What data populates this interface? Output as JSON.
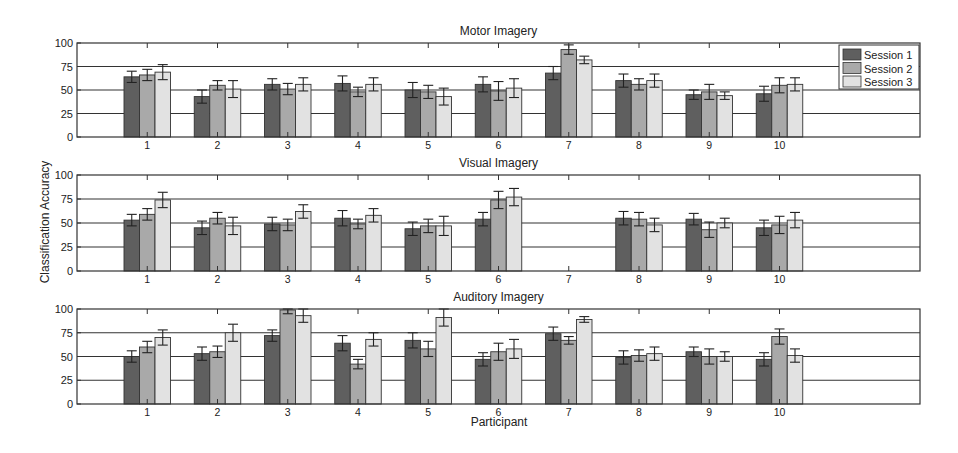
{
  "figure": {
    "ylabel": "Classification Accuracy",
    "xlabel": "Participant",
    "colors": {
      "Session 1": "#5f5f5f",
      "Session 2": "#a9a9a9",
      "Session 3": "#e2e2e2"
    },
    "legend": {
      "position": "upper right of top panel",
      "entries": [
        "Session 1",
        "Session 2",
        "Session 3"
      ]
    }
  },
  "chart_data": [
    {
      "type": "bar",
      "title": "Motor Imagery",
      "xlabel": "",
      "ylabel": "Classification Accuracy",
      "categories": [
        "1",
        "2",
        "3",
        "4",
        "5",
        "6",
        "7",
        "8",
        "9",
        "10"
      ],
      "ylim": [
        0,
        100
      ],
      "yticks": [
        0,
        25,
        50,
        75,
        100
      ],
      "grid": "horizontal lines at 25, 50, 75",
      "legend": [
        "Session 1",
        "Session 2",
        "Session 3"
      ],
      "series": [
        {
          "name": "Session 1",
          "values": [
            64,
            43,
            56,
            57,
            50,
            56,
            68,
            60,
            45,
            46
          ],
          "errors": [
            6,
            7,
            6,
            8,
            8,
            8,
            7,
            7,
            5,
            8
          ]
        },
        {
          "name": "Session 2",
          "values": [
            66,
            55,
            51,
            48,
            48,
            49,
            93,
            56,
            48,
            55
          ],
          "errors": [
            6,
            5,
            6,
            5,
            7,
            10,
            5,
            6,
            8,
            8
          ]
        },
        {
          "name": "Session 3",
          "values": [
            69,
            51,
            56,
            56,
            43,
            52,
            82,
            60,
            44,
            56
          ],
          "errors": [
            8,
            9,
            7,
            7,
            9,
            10,
            4,
            7,
            4,
            7
          ]
        }
      ]
    },
    {
      "type": "bar",
      "title": "Visual Imagery",
      "xlabel": "",
      "ylabel": "Classification Accuracy",
      "categories": [
        "1",
        "2",
        "3",
        "4",
        "5",
        "6",
        "7",
        "8",
        "9",
        "10"
      ],
      "ylim": [
        0,
        100
      ],
      "yticks": [
        0,
        25,
        50,
        75,
        100
      ],
      "grid": "horizontal lines at 25, 50, 75",
      "series": [
        {
          "name": "Session 1",
          "values": [
            53,
            45,
            49,
            55,
            44,
            54,
            null,
            55,
            54,
            45
          ],
          "errors": [
            6,
            7,
            7,
            8,
            7,
            7,
            null,
            7,
            6,
            8
          ]
        },
        {
          "name": "Session 2",
          "values": [
            59,
            55,
            48,
            49,
            47,
            74,
            null,
            54,
            43,
            48
          ],
          "errors": [
            6,
            6,
            6,
            5,
            7,
            9,
            null,
            7,
            8,
            9
          ]
        },
        {
          "name": "Session 3",
          "values": [
            74,
            47,
            62,
            58,
            47,
            77,
            null,
            48,
            50,
            53
          ],
          "errors": [
            8,
            9,
            7,
            7,
            10,
            9,
            null,
            7,
            5,
            8
          ]
        }
      ]
    },
    {
      "type": "bar",
      "title": "Auditory Imagery",
      "xlabel": "Participant",
      "ylabel": "Classification Accuracy",
      "categories": [
        "1",
        "2",
        "3",
        "4",
        "5",
        "6",
        "7",
        "8",
        "9",
        "10"
      ],
      "ylim": [
        0,
        100
      ],
      "yticks": [
        0,
        25,
        50,
        75,
        100
      ],
      "grid": "horizontal lines at 25, 50, 75",
      "series": [
        {
          "name": "Session 1",
          "values": [
            50,
            53,
            72,
            64,
            67,
            47,
            74,
            49,
            55,
            47
          ],
          "errors": [
            6,
            7,
            6,
            8,
            8,
            7,
            7,
            7,
            5,
            7
          ]
        },
        {
          "name": "Session 2",
          "values": [
            60,
            55,
            99,
            42,
            58,
            55,
            67,
            51,
            50,
            71
          ],
          "errors": [
            6,
            6,
            4,
            5,
            8,
            9,
            4,
            6,
            8,
            8
          ]
        },
        {
          "name": "Session 3",
          "values": [
            70,
            75,
            93,
            68,
            91,
            58,
            89,
            53,
            50,
            51
          ],
          "errors": [
            8,
            9,
            7,
            7,
            9,
            10,
            3,
            7,
            5,
            7
          ]
        }
      ]
    }
  ]
}
